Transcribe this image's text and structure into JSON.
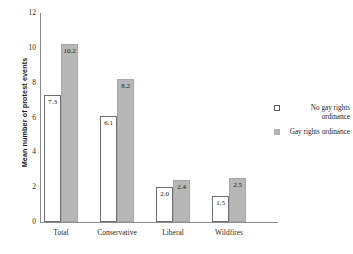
{
  "chart_data": {
    "type": "bar",
    "title": "",
    "xlabel": "",
    "ylabel": "Mean number of protest events",
    "categories": [
      "Total",
      "Conservative",
      "Liberal",
      "Wildfires"
    ],
    "series": [
      {
        "name": "No gay rights ordinance",
        "color": "#ffffff",
        "border_color": "#6e6e6e",
        "values": [
          7.3,
          6.1,
          2.0,
          1.5
        ],
        "labels": [
          "7.3",
          "6.1",
          "2.0",
          "1.5"
        ]
      },
      {
        "name": "Gay rights ordinance",
        "color": "#b7b7b7",
        "border_color": "#a8a8a8",
        "values": [
          10.2,
          8.2,
          2.4,
          2.5
        ],
        "labels": [
          "10.2",
          "8.2",
          "2.4",
          "2.5"
        ]
      }
    ],
    "ylim": [
      0,
      12
    ],
    "yticks": [
      0,
      2,
      4,
      6,
      8,
      10,
      12
    ],
    "ytick_labels": [
      "0",
      "2",
      "4",
      "6",
      "8",
      "10",
      "12"
    ],
    "grid": false,
    "legend_position": "right"
  },
  "legend": {
    "items": [
      {
        "label": "No gay rights ordinance",
        "swatch": "light"
      },
      {
        "label": "Gay rights ordinance",
        "swatch": "dark"
      }
    ]
  },
  "colors": {
    "axis": "#8a8a8a",
    "text": "#1a1a1a",
    "background": "#ffffff",
    "bar_light": "#ffffff",
    "bar_dark": "#b7b7b7"
  }
}
